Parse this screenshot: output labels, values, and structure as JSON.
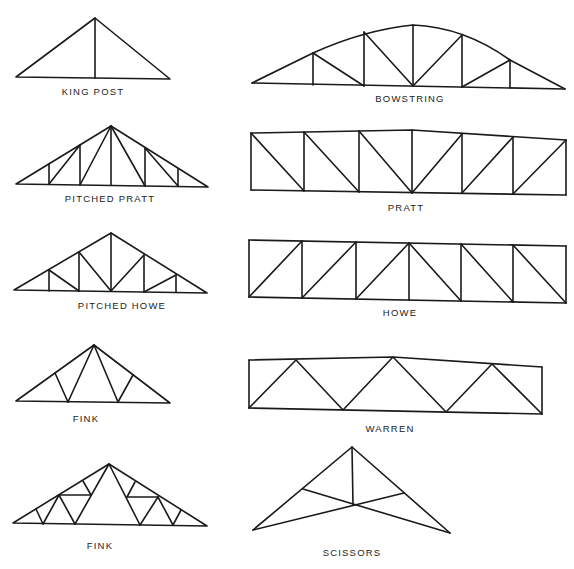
{
  "diagram": {
    "title": "",
    "line_color": "#1a1a1a",
    "background": "#ffffff",
    "trusses": [
      {
        "id": "king-post",
        "label": "KING POST",
        "column": "left",
        "row": 1
      },
      {
        "id": "bowstring",
        "label": "BOWSTRING",
        "column": "right",
        "row": 1
      },
      {
        "id": "pitched-pratt",
        "label": "PITCHED PRATT",
        "column": "left",
        "row": 2
      },
      {
        "id": "pratt",
        "label": "PRATT",
        "column": "right",
        "row": 2
      },
      {
        "id": "pitched-howe",
        "label": "PITCHED HOWE",
        "column": "left",
        "row": 3
      },
      {
        "id": "howe",
        "label": "HOWE",
        "column": "right",
        "row": 3
      },
      {
        "id": "fink-1",
        "label": "FINK",
        "column": "left",
        "row": 4
      },
      {
        "id": "warren",
        "label": "WARREN",
        "column": "right",
        "row": 4
      },
      {
        "id": "fink-2",
        "label": "FINK",
        "column": "left",
        "row": 5
      },
      {
        "id": "scissors",
        "label": "SCISSORS",
        "column": "right",
        "row": 5
      }
    ]
  }
}
